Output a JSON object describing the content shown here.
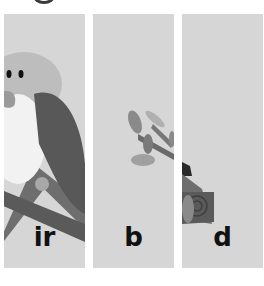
{
  "panels": [
    {
      "label": "ir",
      "image": "bird-head-and-wing"
    },
    {
      "label": "b",
      "image": "branch-with-leaves"
    },
    {
      "label": "d",
      "image": "bird-tail-on-branch"
    }
  ],
  "colors": {
    "panel_bg": "#d6d6d6",
    "page_bg": "#ffffff",
    "text": "#111111"
  }
}
